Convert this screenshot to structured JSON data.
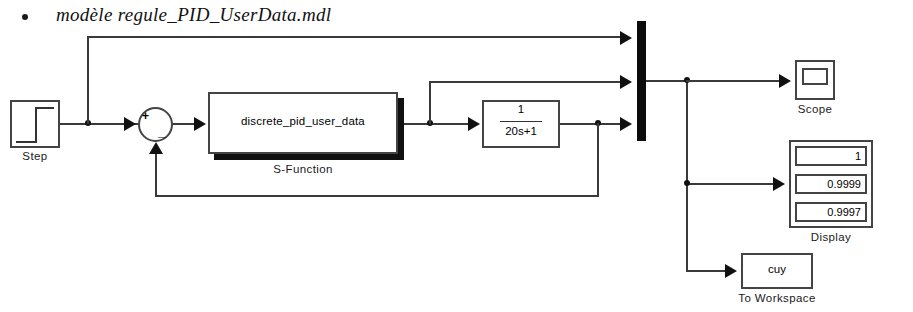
{
  "caption": {
    "bullet": "•",
    "text": "modèle regule_PID_UserData.mdl"
  },
  "diagram": {
    "type": "simulink-block-diagram",
    "blocks": {
      "step": {
        "label": "Step",
        "icon": "step-waveform-icon"
      },
      "sum": {
        "plus": "+",
        "minus": "_",
        "icon": "sum-junction-icon"
      },
      "s_function": {
        "text": "discrete_pid_user_data",
        "label": "S-Function"
      },
      "transfer_function": {
        "numerator": "1",
        "denominator": "20s+1"
      },
      "mux": {
        "label": "",
        "inputs": 3
      },
      "scope": {
        "label": "Scope",
        "icon": "scope-screen-icon"
      },
      "display": {
        "label": "Display",
        "values": [
          "1",
          "0.9999",
          "0.9997"
        ]
      },
      "to_workspace": {
        "text": "cuy",
        "label": "To Workspace"
      }
    }
  },
  "colors": {
    "wire": "#3a3a3a",
    "block_border": "#444444",
    "mux_fill": "#0c0c0c",
    "shadow": "#111111",
    "background": "#ffffff"
  }
}
